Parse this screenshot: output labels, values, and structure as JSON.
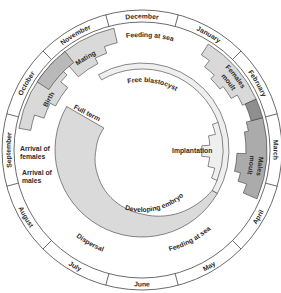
{
  "figure": {
    "months": [
      "December",
      "January",
      "February",
      "March",
      "April",
      "May",
      "June",
      "July",
      "August",
      "September",
      "October",
      "November"
    ],
    "outer_activities": {
      "feeding_at_sea_winter": "Feeding at sea",
      "feeding_at_sea_spring": "Feeding at sea",
      "dispersal": "Dispersal",
      "arrival_of_females": [
        "Arrival of",
        "females"
      ],
      "arrival_of_males": [
        "Arrival of",
        "males"
      ],
      "mating": "Mating",
      "birth": "Birth",
      "females_moult": [
        "Females",
        "moult"
      ],
      "males_moult": [
        "Males",
        "moult"
      ]
    },
    "embryo_stages": {
      "free_blastocyst": "Free blastocyst",
      "implantation": "Implantation",
      "developing_embryo": "Developing embryo",
      "full_term": "Full term"
    }
  },
  "colors": {
    "background": "#ffffff",
    "line": "#3a3a3a",
    "light_shade": "#d9d9d9",
    "overlap_light": "#b9b9b9",
    "males_moult": "#ababab",
    "overlap_dark": "#8f8f8f",
    "blastocyst_band": "#efefef",
    "developing_embryo": "#dadada"
  }
}
